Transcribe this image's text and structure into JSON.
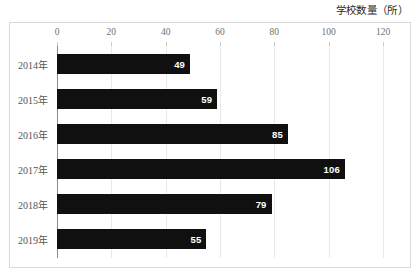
{
  "chart_data": {
    "type": "bar",
    "orientation": "horizontal",
    "title": "学校数量（所）",
    "xlabel": "",
    "ylabel": "",
    "categories": [
      "2014年",
      "2015年",
      "2016年",
      "2017年",
      "2018年",
      "2019年"
    ],
    "values": [
      49,
      59,
      85,
      106,
      79,
      55
    ],
    "xlim": [
      0,
      120
    ],
    "xticks": [
      0,
      20,
      40,
      60,
      80,
      100,
      120
    ],
    "xtick_labels": [
      "0",
      "20",
      "40",
      "60",
      "80",
      "100",
      "120"
    ],
    "grid": "vertical",
    "legend": "none",
    "bar_color": "#101010",
    "value_label_color": "#ffffff",
    "gridline_color": "#e9e9e9",
    "axis_color": "#8a8a8a",
    "frame_color": "#d8d8d8",
    "series": [
      {
        "name": "学校数量",
        "points": [
          {
            "category": "2014年",
            "value": 49
          },
          {
            "category": "2015年",
            "value": 59
          },
          {
            "category": "2016年",
            "value": 85
          },
          {
            "category": "2017年",
            "value": 106
          },
          {
            "category": "2018年",
            "value": 79
          },
          {
            "category": "2019年",
            "value": 55
          }
        ]
      }
    ]
  }
}
